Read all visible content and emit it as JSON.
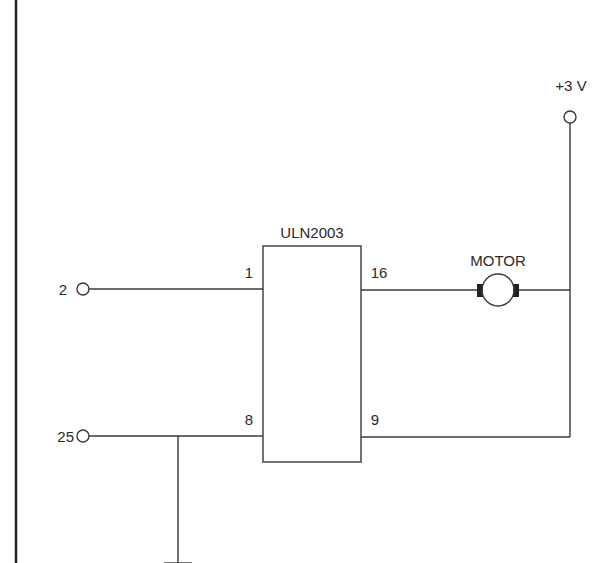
{
  "diagram": {
    "type": "circuit-schematic",
    "colors": {
      "line": "#3a3a3a",
      "text": "#2a2a2a",
      "background": "#ffffff"
    },
    "ic": {
      "name": "ULN2003"
    },
    "pins": {
      "in1": "1",
      "out16": "16",
      "gnd8": "8",
      "com9": "9"
    },
    "terminals": {
      "data": "2",
      "ground": "25"
    },
    "supply": {
      "label": "+3 V"
    },
    "load": {
      "label": "MOTOR"
    },
    "ground_symbol": "ground-icon"
  }
}
